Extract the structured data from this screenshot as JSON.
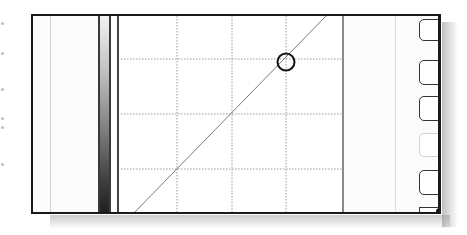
{
  "editor": {
    "type": "curves-editor",
    "colors": {
      "frame": "#1a1a1a",
      "grid": "#9a9a9a",
      "curve": "#7a7a7a",
      "control_point": "#111111",
      "gradient_top": "#f2f2f2",
      "gradient_bottom": "#202020"
    },
    "graph": {
      "grid_divisions": 4,
      "curve_start": {
        "x": 10,
        "y": 200
      },
      "curve_end": {
        "x": 205,
        "y": 0
      },
      "control_point": {
        "x": 165,
        "y": 46,
        "radius": 9
      }
    }
  },
  "side_buttons": [
    {
      "label": "C",
      "state": "normal"
    },
    {
      "label": "L",
      "state": "normal"
    },
    {
      "label": "S",
      "state": "normal"
    },
    {
      "label": "S",
      "state": "disabled"
    },
    {
      "label": "",
      "state": "normal"
    },
    {
      "label": "",
      "state": "partial"
    }
  ]
}
